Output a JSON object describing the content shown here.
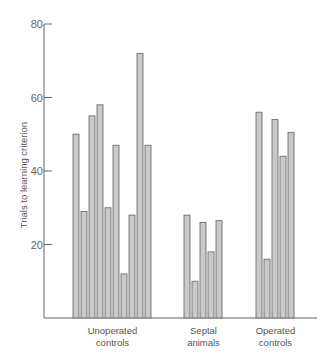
{
  "chart_data": {
    "type": "bar",
    "title": "",
    "xlabel": "",
    "ylabel": "Trials to learning criterion",
    "ylim": [
      0,
      80
    ],
    "yticks": [
      20,
      40,
      60,
      80
    ],
    "grid": false,
    "legend": null,
    "groups": [
      {
        "name": "Unoperated controls",
        "label_lines": [
          "Unoperated",
          "controls"
        ],
        "values": [
          50,
          29,
          55,
          58,
          30,
          47,
          12,
          28,
          72,
          47
        ]
      },
      {
        "name": "Septal animals",
        "label_lines": [
          "Septal",
          "animals"
        ],
        "values": [
          28,
          10,
          26,
          18,
          26.5
        ]
      },
      {
        "name": "Operated controls",
        "label_lines": [
          "Operated",
          "controls"
        ],
        "values": [
          56,
          16,
          54,
          44,
          50.5
        ]
      }
    ]
  },
  "style": {
    "bar_fill": "#c9c9c9",
    "bar_stroke": "#6e6e6e",
    "axis_color": "#555555"
  }
}
